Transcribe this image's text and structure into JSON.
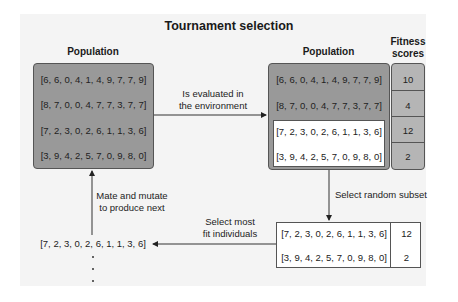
{
  "title": "Tournament selection",
  "left_population": {
    "label": "Population",
    "rows": [
      "[6, 6, 0, 4, 1, 4, 9, 7, 7, 9]",
      "[8, 7, 0, 0, 4, 7, 7, 3, 7, 7]",
      "[7, 2, 3, 0, 2, 6, 1, 1, 3, 6]",
      "[3, 9, 4, 2, 5, 7, 0, 9, 8, 0]"
    ]
  },
  "right_population": {
    "label": "Population",
    "rows": [
      "[6, 6, 0, 4, 1, 4, 9, 7, 7, 9]",
      "[8, 7, 0, 0, 4, 7, 7, 3, 7, 7]",
      "[7, 2, 3, 0, 2, 6, 1, 1, 3, 6]",
      "[3, 9, 4, 2, 5, 7, 0, 9, 8, 0]"
    ]
  },
  "fitness": {
    "label_line1": "Fitness",
    "label_line2": "scores",
    "scores": [
      "10",
      "4",
      "12",
      "2"
    ]
  },
  "arrows": {
    "evaluate_line1": "Is evaluated in",
    "evaluate_line2": "the environment",
    "subset": "Select random subset",
    "select_line1": "Select most",
    "select_line2": "fit individuals",
    "mate_line1": "Mate and mutate",
    "mate_line2": "to produce next"
  },
  "subset_table": {
    "rows": [
      {
        "individual": "[7, 2, 3, 0, 2, 6, 1, 1, 3, 6]",
        "score": "12"
      },
      {
        "individual": "[3, 9, 4, 2, 5, 7, 0, 9, 8, 0]",
        "score": "2"
      }
    ]
  },
  "next_generation": {
    "first": "[7, 2, 3, 0, 2, 6, 1, 1, 3, 6]"
  }
}
